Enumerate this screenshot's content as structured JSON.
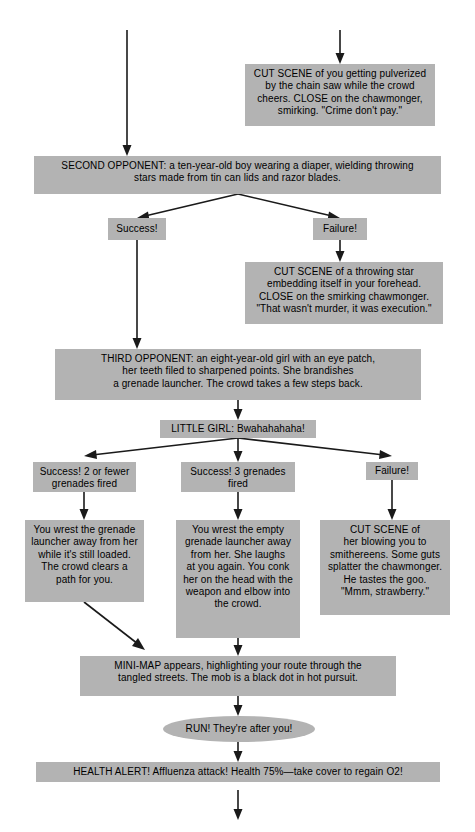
{
  "diagram": {
    "box_color": "#b3b3b3",
    "line_color": "#1a1a1a",
    "background": "#ffffff",
    "nodes": {
      "cut_scene_chainsaw": "CUT SCENE of you getting pulverized\nby the chain saw while the crowd\ncheers. CLOSE on the chawmonger,\nsmirking. \"Crime don't pay.\"",
      "second_opponent": "SECOND OPPONENT: a ten-year-old boy wearing a diaper, wielding throwing\nstars made from tin can lids and razor blades.",
      "success_1": "Success!",
      "failure_1": "Failure!",
      "cut_scene_throwing_star": "CUT SCENE of a throwing star\nembedding itself in your forehead.\nCLOSE on the smirking chawmonger.\n\"That wasn't murder, it was execution.\"",
      "third_opponent": "THIRD OPPONENT: an eight-year-old girl with an eye patch,\nher teeth filed to sharpened points. She brandishes\na grenade launcher. The crowd takes a few steps back.",
      "little_girl": "LITTLE GIRL: Bwahahahaha!",
      "success_two_or_fewer": "Success! 2 or fewer\ngrenades fired",
      "success_three": "Success! 3 grenades\nfired",
      "failure_2": "Failure!",
      "wrest_loaded": "You wrest the grenade\nlauncher away from her\nwhile it's still loaded.\nThe crowd clears a\npath for you.",
      "wrest_empty": "You wrest the empty\ngrenade launcher away\nfrom her. She laughs\nat you again. You conk\nher on the head with the\nweapon and elbow into\nthe crowd.",
      "cut_scene_smithereens": "CUT SCENE of\nher blowing you to\nsmithereens. Some guts\nsplatter the chawmonger.\nHe tastes the goo.\n\"Mmm, strawberry.\"",
      "mini_map": "MINI-MAP appears, highlighting your route through the\ntangled streets. The mob is a black dot in hot pursuit.",
      "run_after_you": "RUN! They're after you!",
      "health_alert": "HEALTH ALERT! Affluenza attack! Health 75%—take cover to regain O2!"
    }
  }
}
